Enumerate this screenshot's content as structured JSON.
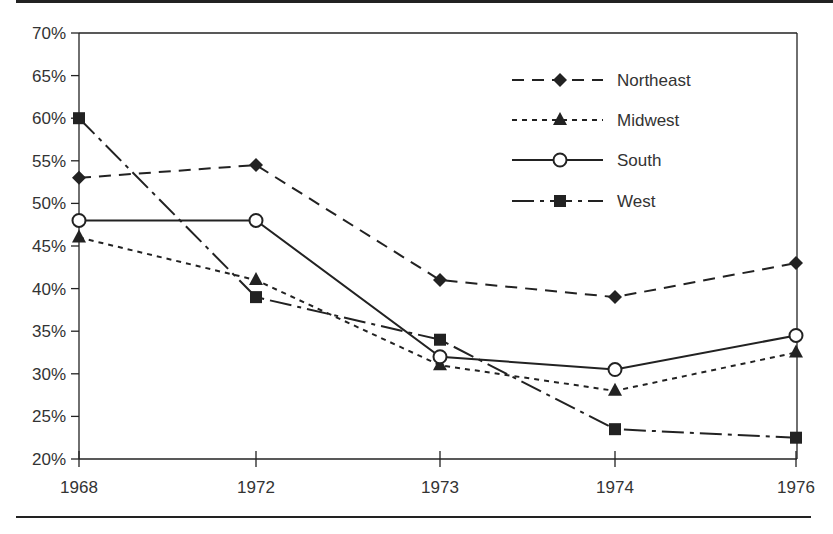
{
  "chart_data": {
    "type": "line",
    "title": "",
    "xlabel": "",
    "ylabel": "",
    "categories": [
      "1968",
      "1972",
      "1973",
      "1974",
      "1976"
    ],
    "yticks": [
      "20%",
      "25%",
      "30%",
      "35%",
      "40%",
      "45%",
      "50%",
      "55%",
      "60%",
      "65%",
      "70%"
    ],
    "ylim": [
      20,
      70
    ],
    "grid": false,
    "legend_position": "upper right (inside plot)",
    "series": [
      {
        "name": "Northeast",
        "marker": "diamond",
        "line": "dashed",
        "values": [
          53,
          54.5,
          41,
          39,
          43
        ]
      },
      {
        "name": "Midwest",
        "marker": "triangle",
        "line": "dotted",
        "values": [
          46,
          41,
          31,
          28,
          32.5
        ]
      },
      {
        "name": "South",
        "marker": "open-circle",
        "line": "solid",
        "values": [
          48,
          48,
          32,
          30.5,
          34.5
        ]
      },
      {
        "name": "West",
        "marker": "square",
        "line": "dash-dot",
        "values": [
          60,
          39,
          34,
          23.5,
          22.5
        ]
      }
    ]
  },
  "legend": {
    "items": [
      "Northeast",
      "Midwest",
      "South",
      "West"
    ]
  },
  "axis": {
    "x_labels": [
      "1968",
      "1972",
      "1973",
      "1974",
      "1976"
    ],
    "y_labels": [
      "70%",
      "65%",
      "60%",
      "55%",
      "50%",
      "45%",
      "40%",
      "35%",
      "30%",
      "25%",
      "20%"
    ]
  },
  "colors": {
    "ink": "#222222",
    "background": "#ffffff"
  }
}
